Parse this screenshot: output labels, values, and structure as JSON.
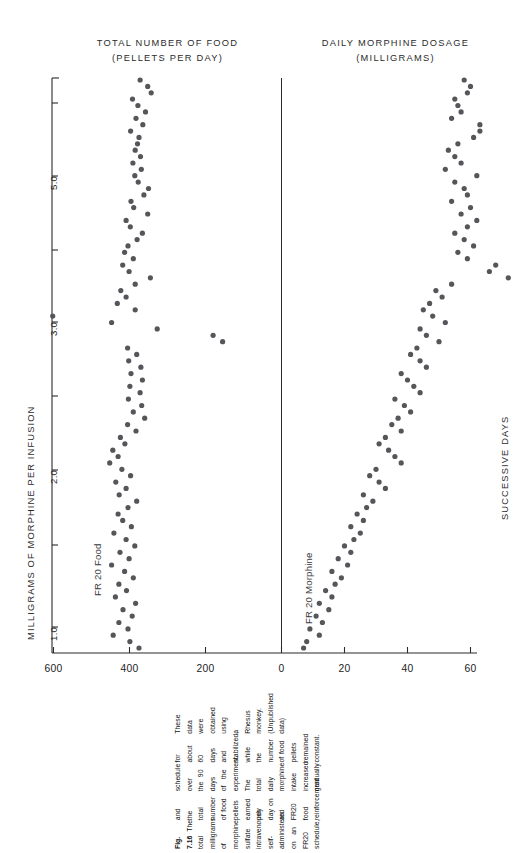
{
  "figure": {
    "number": "Fig. 7.16",
    "caption": "The total milligrams of morphine sulfate intravenously self-administered on an FR20 schedule, and the total number of food pellets earned per day on an FR20 food reinforcement schedule over the 90 days of the experiment. The total daily morphine intake increased gradually for about 60 days and stabilized, while the number of food pellets remained constant. These data were obtained using a Rhesus monkey. (Unpublished data)"
  },
  "panels": {
    "left": {
      "title_line1": "TOTAL NUMBER OF FOOD",
      "title_line2": "(PELLETS PER DAY)",
      "series_label": "FR 20 Food",
      "axis_ticks": [
        "600",
        "400",
        "200",
        "0"
      ]
    },
    "right": {
      "title_line1": "DAILY MORPHINE DOSAGE",
      "title_line2": "(MILLIGRAMS)",
      "series_label": "FR 20 Morphine",
      "axis_ticks": [
        "0",
        "60",
        "40",
        "20"
      ]
    }
  },
  "axes": {
    "left_label": "MILLIGRAMS OF MORPHINE PER INFUSION",
    "left_ticks": [
      "1.0",
      "2.0",
      "3.0",
      "5.0"
    ],
    "right_label": "SUCCESSIVE DAYS"
  },
  "style": {
    "dot_color": "#55565a",
    "axis_color": "#2b2b2b",
    "text_color": "#1a1a1a"
  },
  "chart_data": {
    "type": "scatter",
    "xlabel": "SUCCESSIVE DAYS",
    "ylabel_left": "TOTAL NUMBER OF FOOD (PELLETS PER DAY)",
    "ylabel_right": "DAILY MORPHINE DOSAGE (MILLIGRAMS)",
    "secondary_axis_label": "MILLIGRAMS OF MORPHINE PER INFUSION",
    "secondary_axis_ticks": [
      1.0,
      2.0,
      3.0,
      5.0
    ],
    "orientation": "rotated-90ccw",
    "grid": false,
    "legend": "inline-labels",
    "food_axis": {
      "ticks": [
        600,
        400,
        200,
        0
      ],
      "range": [
        700,
        0
      ]
    },
    "morphine_axis": {
      "ticks": [
        0,
        60,
        40,
        20
      ],
      "range": [
        0,
        70
      ]
    },
    "series": [
      {
        "name": "FR 20 Food",
        "unit": "pellets per day",
        "x_is_day": true,
        "points": [
          [
            90,
            372
          ],
          [
            89,
            352
          ],
          [
            88,
            343
          ],
          [
            87,
            392
          ],
          [
            86,
            378
          ],
          [
            85,
            358
          ],
          [
            84,
            383
          ],
          [
            83,
            365
          ],
          [
            82,
            397
          ],
          [
            81,
            375
          ],
          [
            80,
            379
          ],
          [
            79,
            385
          ],
          [
            78,
            371
          ],
          [
            77,
            391
          ],
          [
            76,
            369
          ],
          [
            75,
            386
          ],
          [
            74,
            377
          ],
          [
            73,
            350
          ],
          [
            72,
            362
          ],
          [
            71,
            396
          ],
          [
            70,
            389
          ],
          [
            69,
            352
          ],
          [
            68,
            409
          ],
          [
            67,
            398
          ],
          [
            66,
            366
          ],
          [
            65,
            380
          ],
          [
            64,
            404
          ],
          [
            63,
            413
          ],
          [
            62,
            390
          ],
          [
            61,
            418
          ],
          [
            60,
            401
          ],
          [
            59,
            345
          ],
          [
            58,
            385
          ],
          [
            57,
            423
          ],
          [
            56,
            409
          ],
          [
            55,
            432
          ],
          [
            54,
            385
          ],
          [
            53,
            602
          ],
          [
            52,
            447
          ],
          [
            51,
            327
          ],
          [
            50,
            180
          ],
          [
            49,
            155
          ],
          [
            48,
            405
          ],
          [
            47,
            381
          ],
          [
            46,
            402
          ],
          [
            45,
            370
          ],
          [
            44,
            396
          ],
          [
            43,
            366
          ],
          [
            42,
            399
          ],
          [
            41,
            372
          ],
          [
            40,
            403
          ],
          [
            39,
            368
          ],
          [
            38,
            390
          ],
          [
            37,
            360
          ],
          [
            36,
            405
          ],
          [
            35,
            383
          ],
          [
            34,
            424
          ],
          [
            33,
            412
          ],
          [
            32,
            444
          ],
          [
            31,
            430
          ],
          [
            30,
            452
          ],
          [
            29,
            420
          ],
          [
            28,
            397
          ],
          [
            27,
            436
          ],
          [
            26,
            409
          ],
          [
            25,
            427
          ],
          [
            24,
            381
          ],
          [
            23,
            404
          ],
          [
            22,
            430
          ],
          [
            21,
            418
          ],
          [
            20,
            395
          ],
          [
            19,
            441
          ],
          [
            18,
            409
          ],
          [
            17,
            386
          ],
          [
            16,
            425
          ],
          [
            15,
            401
          ],
          [
            14,
            447
          ],
          [
            13,
            413
          ],
          [
            12,
            390
          ],
          [
            11,
            428
          ],
          [
            10,
            408
          ],
          [
            9,
            437
          ],
          [
            8,
            384
          ],
          [
            7,
            417
          ],
          [
            6,
            393
          ],
          [
            5,
            428
          ],
          [
            4,
            404
          ],
          [
            3,
            443
          ],
          [
            2,
            399
          ],
          [
            1,
            375
          ]
        ]
      },
      {
        "name": "FR 20 Morphine",
        "unit": "milligrams per day",
        "x_is_day": true,
        "points": [
          [
            90,
            58
          ],
          [
            89,
            60
          ],
          [
            88,
            59
          ],
          [
            87,
            55
          ],
          [
            86,
            56
          ],
          [
            85,
            57
          ],
          [
            84,
            54
          ],
          [
            83,
            63
          ],
          [
            82,
            63
          ],
          [
            81,
            61
          ],
          [
            80,
            56
          ],
          [
            79,
            53
          ],
          [
            78,
            55
          ],
          [
            77,
            57
          ],
          [
            76,
            52
          ],
          [
            75,
            62
          ],
          [
            74,
            55
          ],
          [
            73,
            58
          ],
          [
            72,
            59
          ],
          [
            71,
            54
          ],
          [
            70,
            60
          ],
          [
            69,
            57
          ],
          [
            68,
            62
          ],
          [
            67,
            59
          ],
          [
            66,
            55
          ],
          [
            65,
            58
          ],
          [
            64,
            61
          ],
          [
            63,
            56
          ],
          [
            62,
            59
          ],
          [
            61,
            68
          ],
          [
            60,
            66
          ],
          [
            59,
            72
          ],
          [
            58,
            54
          ],
          [
            57,
            49
          ],
          [
            56,
            51
          ],
          [
            55,
            47
          ],
          [
            54,
            45
          ],
          [
            53,
            48
          ],
          [
            52,
            52
          ],
          [
            51,
            44
          ],
          [
            50,
            46
          ],
          [
            49,
            50
          ],
          [
            48,
            43
          ],
          [
            47,
            41
          ],
          [
            46,
            44
          ],
          [
            45,
            46
          ],
          [
            44,
            38
          ],
          [
            43,
            40
          ],
          [
            42,
            42
          ],
          [
            41,
            44
          ],
          [
            40,
            36
          ],
          [
            39,
            39
          ],
          [
            38,
            41
          ],
          [
            37,
            37
          ],
          [
            36,
            35
          ],
          [
            35,
            38
          ],
          [
            34,
            33
          ],
          [
            33,
            31
          ],
          [
            32,
            34
          ],
          [
            31,
            36
          ],
          [
            30,
            38
          ],
          [
            29,
            30
          ],
          [
            28,
            28
          ],
          [
            27,
            31
          ],
          [
            26,
            33
          ],
          [
            25,
            26
          ],
          [
            24,
            29
          ],
          [
            23,
            27
          ],
          [
            22,
            24
          ],
          [
            21,
            26
          ],
          [
            20,
            22
          ],
          [
            19,
            25
          ],
          [
            18,
            23
          ],
          [
            17,
            20
          ],
          [
            16,
            22
          ],
          [
            15,
            18
          ],
          [
            14,
            21
          ],
          [
            13,
            16
          ],
          [
            12,
            19
          ],
          [
            11,
            17
          ],
          [
            10,
            14
          ],
          [
            9,
            16
          ],
          [
            8,
            12
          ],
          [
            7,
            15
          ],
          [
            6,
            11
          ],
          [
            5,
            13
          ],
          [
            4,
            9
          ],
          [
            3,
            12
          ],
          [
            2,
            8
          ],
          [
            1,
            7
          ]
        ]
      }
    ]
  }
}
